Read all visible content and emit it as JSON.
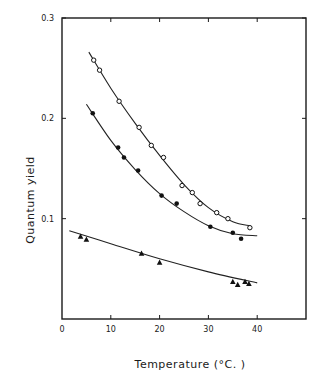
{
  "chart_data": {
    "type": "scatter",
    "title": "",
    "xlabel": "Temperature   (°C. )",
    "ylabel": "Quantum   yield",
    "xlim": [
      0,
      50
    ],
    "ylim": [
      0,
      0.3
    ],
    "xticks": [
      0,
      10,
      20,
      30,
      40
    ],
    "xtick_labels": [
      "0",
      "10",
      "20",
      "30",
      "40"
    ],
    "yticks": [
      0.1,
      0.2,
      0.3
    ],
    "ytick_labels": [
      "0.1",
      "0.2",
      "0.3"
    ],
    "grid": false,
    "legend": null,
    "series": [
      {
        "name": "open circles",
        "marker": "open-circle",
        "points": [
          [
            6.5,
            0.258
          ],
          [
            7.7,
            0.248
          ],
          [
            11.7,
            0.217
          ],
          [
            15.8,
            0.191
          ],
          [
            18.3,
            0.173
          ],
          [
            20.8,
            0.161
          ],
          [
            24.6,
            0.133
          ],
          [
            26.7,
            0.126
          ],
          [
            28.3,
            0.115
          ],
          [
            31.7,
            0.106
          ],
          [
            34.0,
            0.1
          ],
          [
            38.5,
            0.091
          ]
        ],
        "fit": [
          [
            5.5,
            0.266
          ],
          [
            10,
            0.23
          ],
          [
            15,
            0.195
          ],
          [
            20,
            0.163
          ],
          [
            25,
            0.134
          ],
          [
            30,
            0.111
          ],
          [
            35,
            0.097
          ],
          [
            38.5,
            0.093
          ]
        ]
      },
      {
        "name": "filled circles",
        "marker": "filled-circle",
        "points": [
          [
            6.3,
            0.205
          ],
          [
            11.5,
            0.171
          ],
          [
            12.7,
            0.161
          ],
          [
            15.6,
            0.148
          ],
          [
            20.4,
            0.123
          ],
          [
            23.5,
            0.115
          ],
          [
            30.4,
            0.092
          ],
          [
            35.0,
            0.086
          ],
          [
            36.7,
            0.08
          ]
        ],
        "fit": [
          [
            5.0,
            0.214
          ],
          [
            10,
            0.178
          ],
          [
            15,
            0.149
          ],
          [
            20,
            0.125
          ],
          [
            25,
            0.107
          ],
          [
            30,
            0.093
          ],
          [
            35,
            0.085
          ],
          [
            40,
            0.083
          ]
        ]
      },
      {
        "name": "triangles",
        "marker": "filled-triangle",
        "points": [
          [
            3.8,
            0.082
          ],
          [
            5.0,
            0.079
          ],
          [
            16.3,
            0.065
          ],
          [
            20.0,
            0.056
          ],
          [
            35.0,
            0.037
          ],
          [
            36.0,
            0.034
          ],
          [
            37.5,
            0.037
          ],
          [
            38.3,
            0.035
          ]
        ],
        "fit": [
          [
            1.5,
            0.088
          ],
          [
            10,
            0.075
          ],
          [
            20,
            0.06
          ],
          [
            30,
            0.047
          ],
          [
            40,
            0.036
          ]
        ]
      }
    ]
  }
}
